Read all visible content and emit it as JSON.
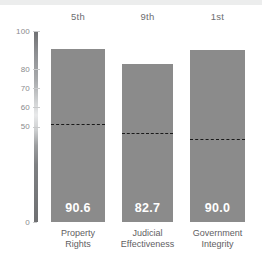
{
  "chart_data": {
    "type": "bar",
    "title": "",
    "subtitle": "",
    "xlabel": "",
    "ylabel": "",
    "ylim": [
      0,
      100
    ],
    "grid": false,
    "legend": "none",
    "categories": [
      "Property Rights",
      "Judicial Effectiveness",
      "Government Integrity"
    ],
    "category_lines": [
      [
        "Property",
        "Rights"
      ],
      [
        "Judicial",
        "Effectiveness"
      ],
      [
        "Government",
        "Integrity"
      ]
    ],
    "values": [
      90.6,
      82.7,
      90.0
    ],
    "value_labels": [
      "90.6",
      "82.7",
      "90.0"
    ],
    "rank_labels": [
      "5th",
      "9th",
      "1st"
    ],
    "reference_lines": [
      51.5,
      46.5,
      43.5
    ],
    "ytick_labels": [
      "100",
      "80",
      "70",
      "60",
      "50",
      "0"
    ],
    "ytick_values": [
      100,
      80,
      70,
      60,
      50,
      0
    ],
    "colors": {
      "bar": "#8b8b8b",
      "value_text": "#ffffff",
      "reference_line": "#1a1a1a",
      "tick_text": "#8a8b8d",
      "category_text": "#5f6062",
      "rank_text": "#6d6e71",
      "background": "#ffffff",
      "top_band": "#eceded"
    }
  }
}
